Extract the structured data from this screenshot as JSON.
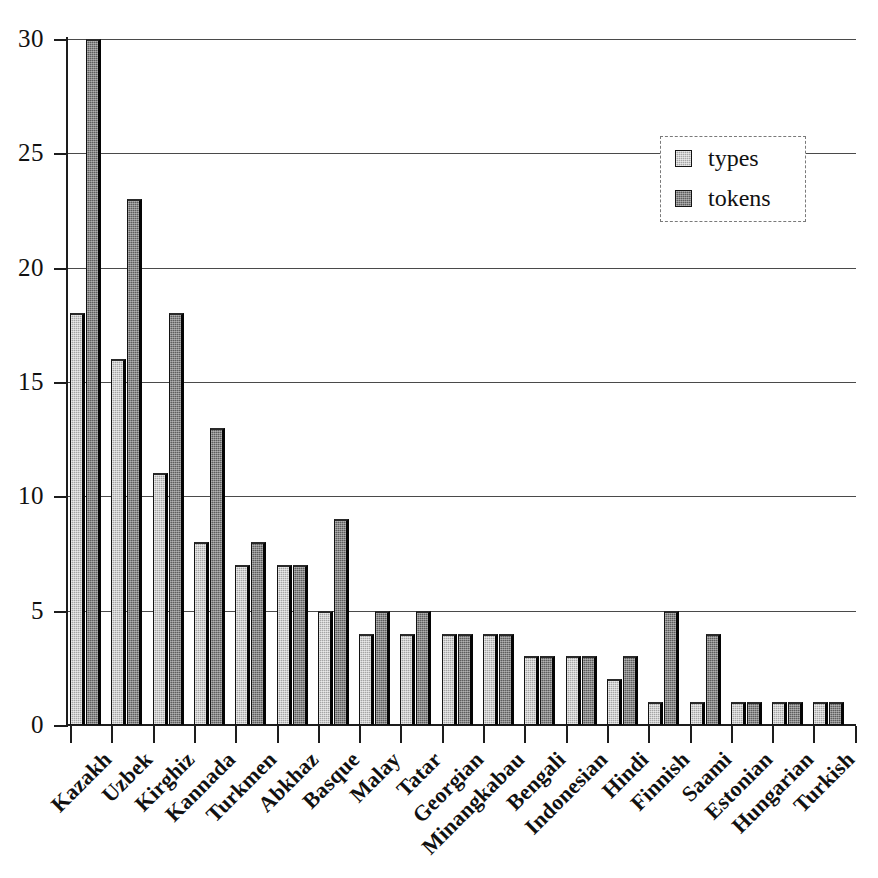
{
  "chart_data": {
    "type": "bar",
    "title": "",
    "subtitle": "",
    "xlabel": "",
    "ylabel": "",
    "ylim": [
      0,
      30
    ],
    "yticks": [
      0,
      5,
      10,
      15,
      20,
      25,
      30
    ],
    "grid": true,
    "legend_position": "top-right",
    "categories": [
      "Kazakh",
      "Uzbek",
      "Kirghiz",
      "Kannada",
      "Turkmen",
      "Abkhaz",
      "Basque",
      "Malay",
      "Tatar",
      "Georgian",
      "Minangkabau",
      "Bengali",
      "Indonesian",
      "Hindi",
      "Finnish",
      "Saami",
      "Estonian",
      "Hungarian",
      "Turkish"
    ],
    "series": [
      {
        "name": "types",
        "color": "#a5a5a5",
        "values": [
          18,
          16,
          11,
          8,
          7,
          7,
          5,
          4,
          4,
          4,
          4,
          3,
          3,
          2,
          1,
          1,
          1,
          1,
          1
        ]
      },
      {
        "name": "tokens",
        "color": "#5d5d5d",
        "values": [
          30,
          23,
          18,
          13,
          8,
          7,
          9,
          5,
          5,
          4,
          4,
          3,
          3,
          3,
          5,
          4,
          1,
          1,
          1
        ]
      }
    ]
  },
  "legend": {
    "items": [
      {
        "label": "types"
      },
      {
        "label": "tokens"
      }
    ]
  }
}
